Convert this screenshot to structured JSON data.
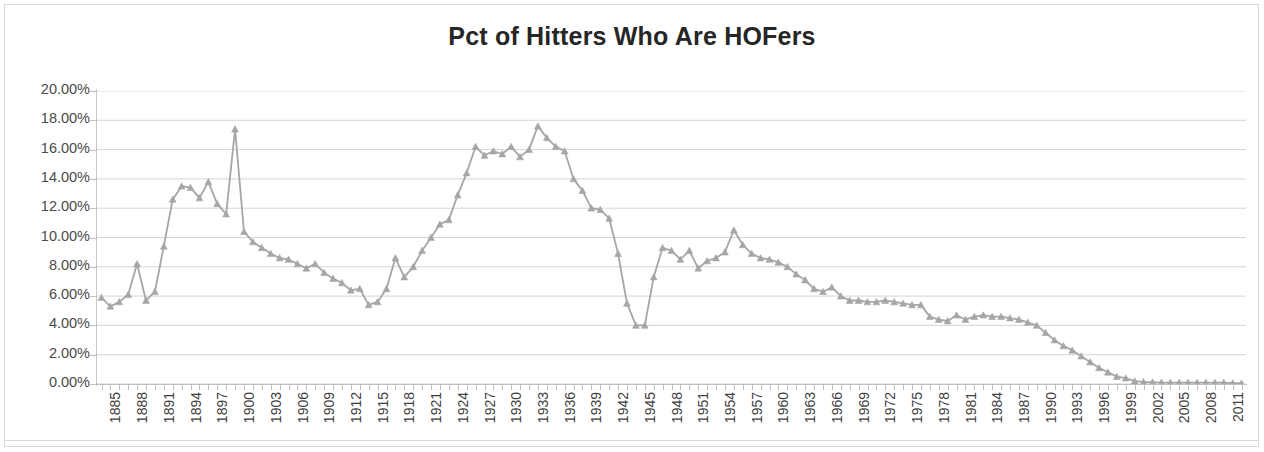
{
  "chart_title": "Pct of Hitters Who Are HOFers",
  "axis": {
    "y_tick_labels": [
      "20.00%",
      "18.00%",
      "16.00%",
      "14.00%",
      "12.00%",
      "10.00%",
      "8.00%",
      "6.00%",
      "4.00%",
      "2.00%",
      "0.00%"
    ],
    "x_tick_labels": [
      "1885",
      "1888",
      "1891",
      "1894",
      "1897",
      "1900",
      "1903",
      "1906",
      "1909",
      "1912",
      "1915",
      "1918",
      "1921",
      "1924",
      "1927",
      "1930",
      "1933",
      "1936",
      "1939",
      "1942",
      "1945",
      "1948",
      "1951",
      "1954",
      "1957",
      "1960",
      "1963",
      "1966",
      "1969",
      "1972",
      "1975",
      "1978",
      "1981",
      "1984",
      "1987",
      "1990",
      "1993",
      "1996",
      "1999",
      "2002",
      "2005",
      "2008",
      "2011"
    ]
  },
  "style": {
    "series_color": "#a6a6a6",
    "grid_color": "#d0d0d0",
    "axis_color": "#c0c0c0",
    "title_color": "#262626",
    "label_color": "#404040",
    "background": "#ffffff"
  },
  "chart_data": {
    "type": "line",
    "title": "Pct of Hitters Who Are HOFers",
    "xlabel": "",
    "ylabel": "",
    "ylim": [
      0,
      20
    ],
    "y_unit": "percent",
    "y_tick_interval": 2,
    "grid": true,
    "legend": "none",
    "marker": "triangle",
    "x_label_every": 3,
    "x": [
      1885,
      1886,
      1887,
      1888,
      1889,
      1890,
      1891,
      1892,
      1893,
      1894,
      1895,
      1896,
      1897,
      1898,
      1899,
      1900,
      1901,
      1902,
      1903,
      1904,
      1905,
      1906,
      1907,
      1908,
      1909,
      1910,
      1911,
      1912,
      1913,
      1914,
      1915,
      1916,
      1917,
      1918,
      1919,
      1920,
      1921,
      1922,
      1923,
      1924,
      1925,
      1926,
      1927,
      1928,
      1929,
      1930,
      1931,
      1932,
      1933,
      1934,
      1935,
      1936,
      1937,
      1938,
      1939,
      1940,
      1941,
      1942,
      1943,
      1944,
      1945,
      1946,
      1947,
      1948,
      1949,
      1950,
      1951,
      1952,
      1953,
      1954,
      1955,
      1956,
      1957,
      1958,
      1959,
      1960,
      1961,
      1962,
      1963,
      1964,
      1965,
      1966,
      1967,
      1968,
      1969,
      1970,
      1971,
      1972,
      1973,
      1974,
      1975,
      1976,
      1977,
      1978,
      1979,
      1980,
      1981,
      1982,
      1983,
      1984,
      1985,
      1986,
      1987,
      1988,
      1989,
      1990,
      1991,
      1992,
      1993,
      1994,
      1995,
      1996,
      1997,
      1998,
      1999,
      2000,
      2001,
      2002,
      2003,
      2004,
      2005,
      2006,
      2007,
      2008,
      2009,
      2010,
      2011,
      2012,
      2013
    ],
    "series": [
      {
        "name": "Pct of Hitters Who Are HOFers",
        "values": [
          5.9,
          5.3,
          5.6,
          6.1,
          8.2,
          5.7,
          6.3,
          9.4,
          12.6,
          13.5,
          13.4,
          12.7,
          13.8,
          12.3,
          11.6,
          17.4,
          10.4,
          9.7,
          9.3,
          8.9,
          8.6,
          8.5,
          8.2,
          7.9,
          8.2,
          7.6,
          7.2,
          6.9,
          6.4,
          6.5,
          5.4,
          5.6,
          6.5,
          8.6,
          7.3,
          8.0,
          9.1,
          10.0,
          10.9,
          11.2,
          12.9,
          14.4,
          16.2,
          15.6,
          15.9,
          15.7,
          16.2,
          15.5,
          16.0,
          17.6,
          16.8,
          16.2,
          15.9,
          14.0,
          13.2,
          12.0,
          11.9,
          11.3,
          8.9,
          5.5,
          4.0,
          4.0,
          7.3,
          9.3,
          9.1,
          8.5,
          9.1,
          7.9,
          8.4,
          8.6,
          9.0,
          10.5,
          9.5,
          8.9,
          8.6,
          8.5,
          8.3,
          8.0,
          7.5,
          7.1,
          6.5,
          6.3,
          6.6,
          6.0,
          5.7,
          5.7,
          5.6,
          5.6,
          5.7,
          5.6,
          5.5,
          5.4,
          5.4,
          4.6,
          4.4,
          4.3,
          4.7,
          4.4,
          4.6,
          4.7,
          4.6,
          4.6,
          4.5,
          4.4,
          4.2,
          4.0,
          3.5,
          3.0,
          2.6,
          2.3,
          1.9,
          1.5,
          1.1,
          0.8,
          0.5,
          0.4,
          0.2,
          0.15,
          0.12,
          0.1,
          0.1,
          0.1,
          0.1,
          0.1,
          0.1,
          0.1,
          0.1,
          0.05,
          0.05
        ]
      }
    ]
  }
}
